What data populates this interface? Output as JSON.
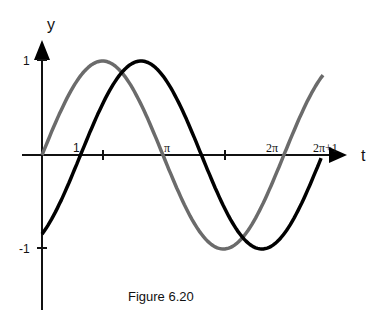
{
  "chart_data": {
    "type": "line",
    "title": "",
    "caption": "Figure 6.20",
    "xlabel": "t",
    "ylabel": "y",
    "xlim": [
      0,
      6.6
    ],
    "ylim": [
      -1.6,
      1.3
    ],
    "grid": false,
    "legend": null,
    "x_ticks": [
      {
        "value": 1,
        "label": "1"
      },
      {
        "value": 2,
        "label": ""
      },
      {
        "value": 3.14159,
        "label": "π"
      },
      {
        "value": 5,
        "label": ""
      },
      {
        "value": 6.28319,
        "label": "2π"
      },
      {
        "value": 7.28319,
        "label": "2π+1"
      }
    ],
    "y_ticks": [
      {
        "value": 1,
        "label": "1"
      },
      {
        "value": -1,
        "label": "-1"
      }
    ],
    "series": [
      {
        "name": "sin(t)",
        "color": "#6b6b6b",
        "x_range": [
          0,
          7.3
        ],
        "points": [
          [
            0,
            0
          ],
          [
            1.571,
            1
          ],
          [
            3.142,
            0
          ],
          [
            4.712,
            -1
          ],
          [
            6.283,
            0
          ],
          [
            7.3,
            0.85
          ]
        ]
      },
      {
        "name": "sin(t-1)",
        "color": "#000000",
        "x_range": [
          0,
          7.28
        ],
        "points": [
          [
            0,
            -0.84
          ],
          [
            1,
            0
          ],
          [
            2.571,
            1
          ],
          [
            4.142,
            0
          ],
          [
            5.712,
            -1
          ],
          [
            7.28,
            0
          ]
        ]
      }
    ]
  }
}
